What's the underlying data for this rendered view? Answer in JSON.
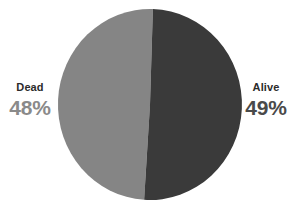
{
  "chart_data": {
    "type": "pie",
    "title": "",
    "subtitle": "",
    "xlabel": "",
    "ylabel": "",
    "legend_position": "none",
    "grid": false,
    "categories": [
      "Dead",
      "Alive"
    ],
    "values": [
      48,
      49
    ],
    "value_labels": [
      "48%",
      "49%"
    ],
    "units": "percent",
    "colors": [
      "#858585",
      "#3a3a3a"
    ],
    "background_color": "#ffffff",
    "slices": [
      {
        "label": "Dead",
        "value": 48,
        "value_label": "48%",
        "color": "#858585",
        "label_color": "#8a8a8a",
        "side": "left"
      },
      {
        "label": "Alive",
        "value": 49,
        "value_label": "49%",
        "color": "#3a3a3a",
        "label_color": "#4a4a4a",
        "side": "right"
      }
    ]
  },
  "labels": {
    "left": {
      "name": "Dead",
      "value": "48%"
    },
    "right": {
      "name": "Alive",
      "value": "49%"
    }
  }
}
